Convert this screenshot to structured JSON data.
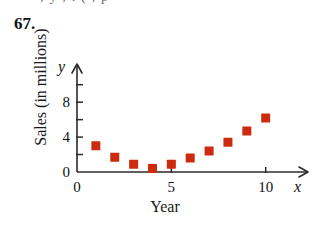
{
  "figure": {
    "exercise_number": "67.",
    "clipped_top_line": ", y   ,    .   ( ,   p",
    "x_axis_title": "Year",
    "y_axis_title": "Sales (in millions)",
    "x_axis_var": "x",
    "y_axis_var": "y",
    "marker_color": "#CC2B0E",
    "axis_color": "#2B2B2B"
  },
  "chart_data": {
    "type": "scatter",
    "title": "",
    "xlabel": "Year",
    "ylabel": "Sales (in millions)",
    "x_axis_variable": "x",
    "y_axis_variable": "y",
    "xlim": [
      0,
      11.5
    ],
    "ylim": [
      0,
      11
    ],
    "xticks": [
      0,
      5,
      10
    ],
    "xtick_labels": [
      "0",
      "5",
      "10"
    ],
    "yticks": [
      0,
      2,
      4,
      6,
      8,
      10
    ],
    "ytick_labels": [
      "0",
      "",
      "4",
      "",
      "8",
      ""
    ],
    "labeled_yticks": [
      0,
      4,
      8
    ],
    "grid": false,
    "legend": false,
    "marker": "square",
    "marker_color": "#CC2B0E",
    "x": [
      1,
      2,
      3,
      4,
      5,
      6,
      7,
      8,
      9,
      10
    ],
    "values": [
      3.0,
      1.7,
      0.9,
      0.4,
      0.9,
      1.6,
      2.4,
      3.4,
      4.7,
      6.2
    ],
    "points": [
      {
        "x": 1,
        "y": 3.0
      },
      {
        "x": 2,
        "y": 1.7
      },
      {
        "x": 3,
        "y": 0.9
      },
      {
        "x": 4,
        "y": 0.4
      },
      {
        "x": 5,
        "y": 0.9
      },
      {
        "x": 6,
        "y": 1.6
      },
      {
        "x": 7,
        "y": 2.4
      },
      {
        "x": 8,
        "y": 3.4
      },
      {
        "x": 9,
        "y": 4.7
      },
      {
        "x": 10,
        "y": 6.2
      }
    ]
  }
}
